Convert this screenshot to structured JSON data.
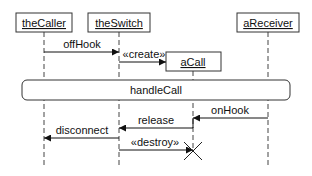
{
  "diagram": {
    "type": "uml-sequence",
    "participants": [
      {
        "name": "theCaller",
        "x": 44
      },
      {
        "name": "theSwitch",
        "x": 119
      },
      {
        "name": "aCall",
        "x": 193
      },
      {
        "name": "aReceiver",
        "x": 268
      }
    ],
    "fragment": {
      "label": "handleCall"
    },
    "messages": [
      {
        "label": "offHook",
        "from": "theCaller",
        "to": "theSwitch"
      },
      {
        "label": "«create»",
        "from": "theSwitch",
        "to": "aCall"
      },
      {
        "label": "onHook",
        "from": "aReceiver",
        "to": "aCall"
      },
      {
        "label": "release",
        "from": "aCall",
        "to": "theSwitch"
      },
      {
        "label": "disconnect",
        "from": "theSwitch",
        "to": "theCaller"
      },
      {
        "label": "«destroy»",
        "from": "theSwitch",
        "to": "aCall"
      }
    ],
    "colors": {
      "line": "#111111",
      "background": "#ffffff"
    }
  }
}
